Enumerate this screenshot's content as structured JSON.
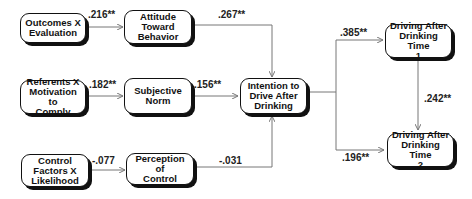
{
  "diagram": {
    "type": "path-diagram",
    "nodes": {
      "outcomes": {
        "label": "Outcomes X\nEvaluation"
      },
      "attitude": {
        "label": "Attitude\nToward\nBehavior"
      },
      "referents": {
        "label": "Referents X\nMotivation to\nComply"
      },
      "subjective_norm": {
        "label": "Subjective\nNorm"
      },
      "control_factors": {
        "label": "Control\nFactors X\nLikelihood"
      },
      "perception": {
        "label": "Perception of\nControl"
      },
      "intention": {
        "label": "Intention to\nDrive After\nDrinking"
      },
      "time1": {
        "label": "Driving After\nDrinking Time\n1"
      },
      "time2": {
        "label": "Driving After\nDrinking Time\n2"
      }
    },
    "edges": {
      "outcomes_attitude": {
        "from": "outcomes",
        "to": "attitude",
        "coef": ".216**"
      },
      "attitude_intention": {
        "from": "attitude",
        "to": "intention",
        "coef": ".267**"
      },
      "referents_norm": {
        "from": "referents",
        "to": "subjective_norm",
        "coef": ".182**"
      },
      "norm_intention": {
        "from": "subjective_norm",
        "to": "intention",
        "coef": ".156**"
      },
      "control_perception": {
        "from": "control_factors",
        "to": "perception",
        "coef": "-.077"
      },
      "perception_intention": {
        "from": "perception",
        "to": "intention",
        "coef": "-.031"
      },
      "intention_time1": {
        "from": "intention",
        "to": "time1",
        "coef": ".385**"
      },
      "intention_time2": {
        "from": "intention",
        "to": "time2",
        "coef": ".196**"
      },
      "time1_time2": {
        "from": "time1",
        "to": "time2",
        "coef": ".242**"
      }
    }
  }
}
